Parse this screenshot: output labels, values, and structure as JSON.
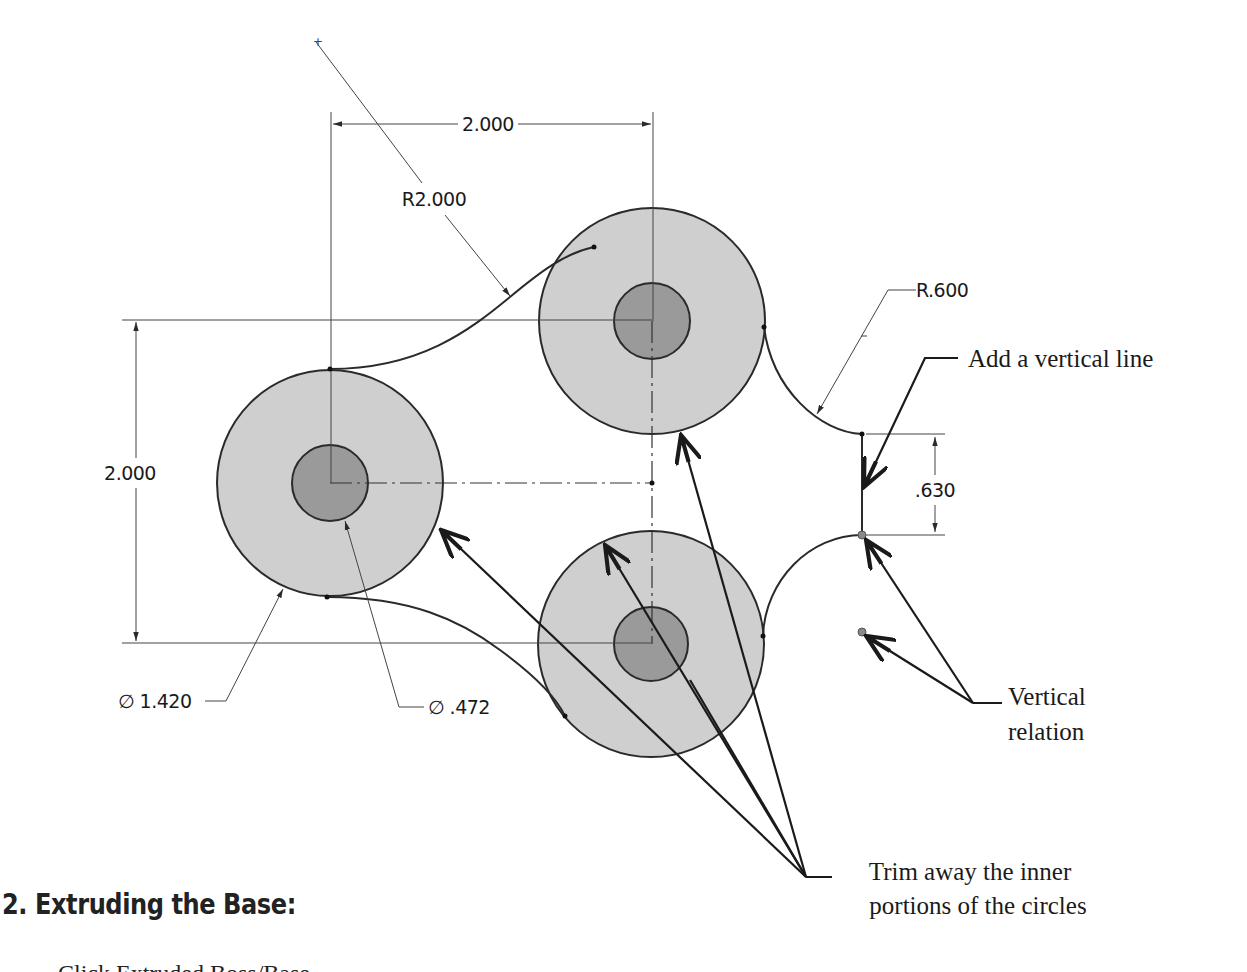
{
  "figure": {
    "dimensions": {
      "horizontal_spacing": "2.000",
      "vertical_spacing": "2.000",
      "arc_radius_large": "R2.000",
      "arc_radius_small": "R.600",
      "line_length": ".630",
      "outer_diameter": "∅ 1.420",
      "inner_diameter": "∅ .472"
    },
    "annotations": {
      "add_vertical_line": "Add a vertical line",
      "vertical_relation_line1": "Vertical",
      "vertical_relation_line2": "relation",
      "trim_line1": "Trim away the inner",
      "trim_line2": "portions of the circles"
    },
    "colors": {
      "outer_fill": "#cfcfcf",
      "inner_fill": "#9a9a9a",
      "stroke": "#2a2a2a",
      "relation_point": "#8a8a8a"
    }
  },
  "section": {
    "heading": "2. Extruding the Base:",
    "body_partial": "Click Extruded Boss/Base"
  }
}
